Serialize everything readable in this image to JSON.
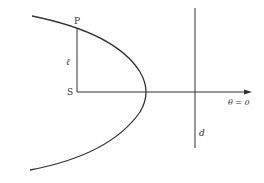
{
  "diagram": {
    "labels": {
      "point": "P",
      "focus": "S",
      "distance": "ℓ",
      "directrix": "d",
      "axis": "θ = 0"
    },
    "colors": {
      "stroke": "#333333",
      "background": "#ffffff"
    }
  }
}
